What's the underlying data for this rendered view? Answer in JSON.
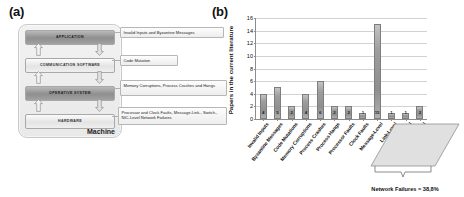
{
  "panels": {
    "a_label": "(a)",
    "b_label": "(b)"
  },
  "diagram": {
    "container_label": "Machine",
    "layers": [
      {
        "name": "APPLICATION",
        "style": "dark"
      },
      {
        "name": "COMMUNICATION SOFTWARE",
        "style": "light"
      },
      {
        "name": "OPERATIVE SYSTEM",
        "style": "dark"
      },
      {
        "name": "HARDWARE",
        "style": "light"
      }
    ],
    "callouts": [
      {
        "text": "Invalid Inputs and Byzantine Messages"
      },
      {
        "text": "Code Mutation"
      },
      {
        "text": "Memory Corruptions, Process Crashes and Hangs"
      },
      {
        "text": "Processor and Clock Faults, Message-Link-, Switch-, NIC-Level Network Failures"
      }
    ],
    "arrow_icons": [
      "arrow-up-icon",
      "arrow-down-icon"
    ]
  },
  "chart_data": {
    "type": "bar",
    "title": "",
    "xlabel": "",
    "ylabel": "Papers in the current literature",
    "ylim": [
      0,
      16
    ],
    "ytick_values": [
      0,
      2,
      4,
      6,
      8,
      10,
      12,
      14,
      16
    ],
    "ytick_labels": [
      "0",
      "2",
      "4",
      "6",
      "8",
      "10",
      "12",
      "14",
      "16"
    ],
    "grid": true,
    "legend": "none",
    "categories": [
      "Invalid Inputs",
      "Byzantine Messages",
      "Code Mutations",
      "Memory Corruptions",
      "Process Crashes",
      "Process Hangs",
      "Processor Faults",
      "Clock Faults",
      "Message-Level",
      "Link-Level",
      "Switch-Level",
      "NIC-Level"
    ],
    "values": [
      4,
      5,
      2,
      4,
      6,
      2,
      2,
      1,
      15,
      1,
      1,
      2
    ],
    "data_labels": [
      "4",
      "5",
      "2",
      "4",
      "6",
      "2",
      "2",
      "1",
      "15",
      "1",
      "1",
      "2"
    ],
    "annotations": [
      {
        "text": "Network Failures = 38,8%",
        "covers": [
          "Message-Level",
          "Link-Level",
          "Switch-Level",
          "NIC-Level"
        ]
      }
    ],
    "bar_color": "#9d9d9d"
  }
}
